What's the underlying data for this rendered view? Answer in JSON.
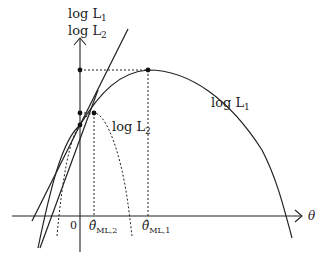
{
  "diagram": {
    "y_axis_label_1": "log L",
    "y_axis_label_1_sub": "1",
    "y_axis_label_2": "log L",
    "y_axis_label_2_sub": "2",
    "x_axis_label": "θ",
    "origin_label": "0",
    "curve1_label": "log L",
    "curve1_label_sub": "1",
    "curve2_label": "log L",
    "curve2_label_sub": "2",
    "theta_ml2_label": "θ̂",
    "theta_ml2_sub": "ML,2",
    "theta_ml1_label": "θ̂",
    "theta_ml1_sub": "ML,1",
    "colors": {
      "line": "#222222",
      "background": "#ffffff"
    }
  }
}
